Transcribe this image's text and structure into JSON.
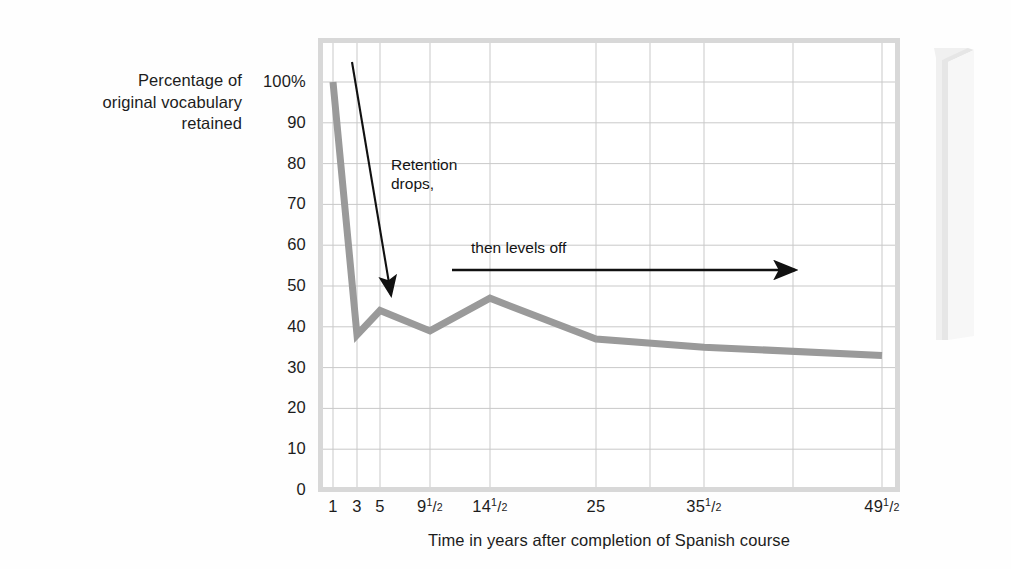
{
  "chart_data": {
    "type": "line",
    "title": "",
    "xlabel": "Time in years after completion of Spanish course",
    "ylabel": "Percentage of original vocabulary retained",
    "ylabel_lines": [
      "Percentage of",
      "original vocabulary",
      "retained"
    ],
    "categories": [
      "1",
      "3",
      "5",
      "9 1/2",
      "14 1/2",
      "25",
      "35 1/2",
      "49 1/2"
    ],
    "x_tick_labels": [
      {
        "whole": "1",
        "numer": "",
        "denom": ""
      },
      {
        "whole": "3",
        "numer": "",
        "denom": ""
      },
      {
        "whole": "5",
        "numer": "",
        "denom": ""
      },
      {
        "whole": "9",
        "numer": "1",
        "denom": "2"
      },
      {
        "whole": "14",
        "numer": "1",
        "denom": "2"
      },
      {
        "whole": "25",
        "numer": "",
        "denom": ""
      },
      {
        "whole": "35",
        "numer": "1",
        "denom": "2"
      },
      {
        "whole": "49",
        "numer": "1",
        "denom": "2"
      }
    ],
    "values": [
      100,
      38,
      44,
      39,
      47,
      37,
      35,
      33
    ],
    "y_tick_labels": [
      "100%",
      "90",
      "80",
      "70",
      "60",
      "50",
      "40",
      "30",
      "20",
      "10",
      "0"
    ],
    "y_tick_values": [
      100,
      90,
      80,
      70,
      60,
      50,
      40,
      30,
      20,
      10,
      0
    ],
    "ylim": [
      0,
      100
    ],
    "grid": true,
    "legend": "none",
    "series_color": "#9a9a9a",
    "grid_color": "#c9c9c9",
    "frame_color": "#d8d8d8",
    "annotations": [
      {
        "name": "retention-drops",
        "text_lines": [
          "Retention",
          "drops,"
        ],
        "arrow": "diagonal-down"
      },
      {
        "name": "levels-off",
        "text_lines": [
          "then levels off"
        ],
        "arrow": "horizontal-right"
      }
    ]
  },
  "annotations": {
    "drops_line1": "Retention",
    "drops_line2": "drops,",
    "levels_off": "then levels off"
  },
  "axis": {
    "x_title": "Time in years after completion of Spanish course",
    "y_title_line1": "Percentage of",
    "y_title_line2": "original vocabulary",
    "y_title_line3": "retained"
  }
}
